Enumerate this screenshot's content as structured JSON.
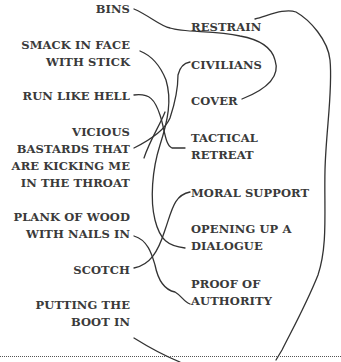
{
  "left_items": [
    {
      "id": "bins",
      "label": "BINS"
    },
    {
      "id": "smack",
      "label": "SMACK IN FACE\nWITH STICK"
    },
    {
      "id": "run",
      "label": "RUN LIKE HELL"
    },
    {
      "id": "vicious",
      "label": "VICIOUS\nBASTARDS THAT\nARE KICKING ME\nIN THE THROAT"
    },
    {
      "id": "plank",
      "label": "PLANK OF WOOD\nWITH NAILS IN"
    },
    {
      "id": "scotch",
      "label": "SCOTCH"
    },
    {
      "id": "boot",
      "label": "PUTTING THE\nBOOT IN"
    }
  ],
  "right_items": [
    {
      "id": "restrain",
      "label": "RESTRAIN"
    },
    {
      "id": "civilians",
      "label": "CIVILIANS"
    },
    {
      "id": "cover",
      "label": "COVER"
    },
    {
      "id": "tactical",
      "label": "TACTICAL\nRETREAT"
    },
    {
      "id": "moral",
      "label": "MORAL SUPPORT"
    },
    {
      "id": "dialogue",
      "label": "OPENING UP A\nDIALOGUE"
    },
    {
      "id": "proof",
      "label": "PROOF OF\nAUTHORITY"
    }
  ],
  "connections": [
    {
      "from": "BINS",
      "to": "RESTRAIN"
    },
    {
      "from": "SMACK IN FACE WITH STICK",
      "to": "OPENING UP A DIALOGUE"
    },
    {
      "from": "RUN LIKE HELL",
      "to": "TACTICAL RETREAT"
    },
    {
      "from": "VICIOUS BASTARDS THAT ARE KICKING ME IN THE THROAT",
      "to": "CIVILIANS"
    },
    {
      "from": "PLANK OF WOOD WITH NAILS IN",
      "to": "PROOF OF AUTHORITY"
    },
    {
      "from": "SCOTCH",
      "to": "MORAL SUPPORT"
    },
    {
      "from": "PUTTING THE BOOT IN",
      "to": "COVER"
    }
  ],
  "colors": {
    "text": "#3a3a3a",
    "line": "#333333",
    "background": "#ffffff"
  }
}
